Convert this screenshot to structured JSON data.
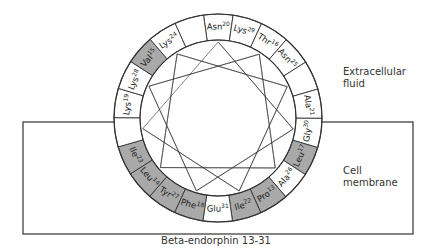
{
  "diagram": {
    "type": "helical-wheel",
    "caption": "Beta-endorphin 13-31",
    "regions": {
      "extracellular": "Extracellular\nfluid",
      "membrane": "Cell\nmembrane"
    },
    "colors": {
      "hydrophobic_fill": "#a9a9a9",
      "polar_fill": "#ffffff",
      "stroke": "#333333"
    },
    "wheel": {
      "center": [
        218,
        118
      ],
      "outer_radius": 104,
      "inner_radius": 78,
      "start_angle_deg": -98,
      "segments": [
        {
          "name": "Asn",
          "num": "20",
          "hydrophobic": false
        },
        {
          "name": "Lys",
          "num": "29",
          "hydrophobic": false
        },
        {
          "name": "Thr",
          "num": "16",
          "hydrophobic": false
        },
        {
          "name": "Asn",
          "num": "25",
          "hydrophobic": false
        },
        {
          "name": "",
          "num": "",
          "hydrophobic": false
        },
        {
          "name": "Ala",
          "num": "21",
          "hydrophobic": false
        },
        {
          "name": "Gly",
          "num": "30",
          "hydrophobic": false
        },
        {
          "name": "Leu",
          "num": "17",
          "hydrophobic": true
        },
        {
          "name": "Ala",
          "num": "26",
          "hydrophobic": false
        },
        {
          "name": "Pro",
          "num": "13",
          "hydrophobic": true
        },
        {
          "name": "Ile",
          "num": "22",
          "hydrophobic": true
        },
        {
          "name": "Glu",
          "num": "31",
          "hydrophobic": false
        },
        {
          "name": "Phe",
          "num": "18",
          "hydrophobic": true
        },
        {
          "name": "Tyr",
          "num": "27",
          "hydrophobic": true
        },
        {
          "name": "Leu",
          "num": "14",
          "hydrophobic": true
        },
        {
          "name": "Ile",
          "num": "23",
          "hydrophobic": true
        },
        {
          "name": "",
          "num": "",
          "hydrophobic": false
        },
        {
          "name": "Lys",
          "num": "19",
          "hydrophobic": false
        },
        {
          "name": "Lys",
          "num": "28",
          "hydrophobic": false
        },
        {
          "name": "Val",
          "num": "15",
          "hydrophobic": true
        },
        {
          "name": "Lys",
          "num": "24",
          "hydrophobic": false
        },
        {
          "name": "",
          "num": "",
          "hydrophobic": false
        }
      ]
    },
    "membrane_box": {
      "x1": 23,
      "y1": 122,
      "x2": 413,
      "y2": 234
    }
  }
}
